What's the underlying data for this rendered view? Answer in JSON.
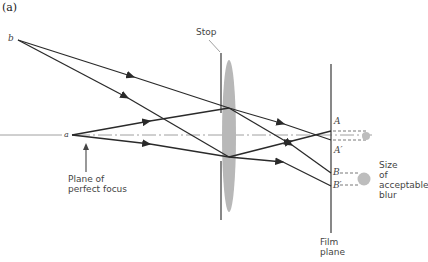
{
  "figure": {
    "panel_label": "(a)",
    "labels": {
      "stop": "Stop",
      "point_b": "b",
      "point_a": "a",
      "plane_of_focus_line1": "Plane of",
      "plane_of_focus_line2": "perfect focus",
      "A": "A",
      "A_prime": "A′",
      "B": "B",
      "B_prime": "B′",
      "blur_line1": "Size",
      "blur_line2": "of",
      "blur_line3": "acceptable",
      "blur_line4": "blur",
      "film_line1": "Film",
      "film_line2": "plane"
    },
    "colors": {
      "ray": "#2a2a2a",
      "lens": "#b8b8b8",
      "axis": "#888888",
      "blur_dot": "#bdbdbd"
    }
  }
}
